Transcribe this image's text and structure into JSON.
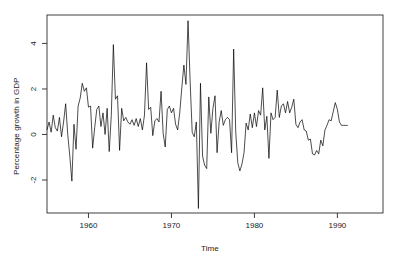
{
  "chart_data": {
    "type": "line",
    "title": "",
    "xlabel": "Time",
    "ylabel": "Percentage growth in GDP",
    "grid": false,
    "legend": null,
    "xlim": [
      1955.0,
      1995.5
    ],
    "ylim": [
      -3.45,
      5.25
    ],
    "xticks": [
      1960,
      1970,
      1980,
      1990
    ],
    "xtick_labels": [
      "1960",
      "1970",
      "1980",
      "1990"
    ],
    "yticks": [
      -2,
      0,
      2,
      4
    ],
    "ytick_labels": [
      "-2",
      "0",
      "2",
      "4"
    ],
    "line_color": "#000000",
    "line_width": 0.7,
    "x": [
      1955.0,
      1955.25,
      1955.5,
      1955.75,
      1956.0,
      1956.25,
      1956.5,
      1956.75,
      1957.0,
      1957.25,
      1957.5,
      1957.75,
      1958.0,
      1958.25,
      1958.5,
      1958.75,
      1959.0,
      1959.25,
      1959.5,
      1959.75,
      1960.0,
      1960.25,
      1960.5,
      1960.75,
      1961.0,
      1961.25,
      1961.5,
      1961.75,
      1962.0,
      1962.25,
      1962.5,
      1962.75,
      1963.0,
      1963.25,
      1963.5,
      1963.75,
      1964.0,
      1964.25,
      1964.5,
      1964.75,
      1965.0,
      1965.25,
      1965.5,
      1965.75,
      1966.0,
      1966.25,
      1966.5,
      1966.75,
      1967.0,
      1967.25,
      1967.5,
      1967.75,
      1968.0,
      1968.25,
      1968.5,
      1968.75,
      1969.0,
      1969.25,
      1969.5,
      1969.75,
      1970.0,
      1970.25,
      1970.5,
      1970.75,
      1971.0,
      1971.25,
      1971.5,
      1971.75,
      1972.0,
      1972.25,
      1972.5,
      1972.75,
      1973.0,
      1973.25,
      1973.5,
      1973.75,
      1974.0,
      1974.25,
      1974.5,
      1974.75,
      1975.0,
      1975.25,
      1975.5,
      1975.75,
      1976.0,
      1976.25,
      1976.5,
      1976.75,
      1977.0,
      1977.25,
      1977.5,
      1977.75,
      1978.0,
      1978.25,
      1978.5,
      1978.75,
      1979.0,
      1979.25,
      1979.5,
      1979.75,
      1980.0,
      1980.25,
      1980.5,
      1980.75,
      1981.0,
      1981.25,
      1981.5,
      1981.75,
      1982.0,
      1982.25,
      1982.5,
      1982.75,
      1983.0,
      1983.25,
      1983.5,
      1983.75,
      1984.0,
      1984.25,
      1984.5,
      1984.75,
      1985.0,
      1985.25,
      1985.5,
      1985.75,
      1986.0,
      1986.25,
      1986.5,
      1986.75,
      1987.0,
      1987.25,
      1987.5,
      1987.75,
      1988.0,
      1988.25,
      1988.5,
      1988.75,
      1989.0,
      1989.25,
      1989.5,
      1989.75,
      1990.0,
      1990.25,
      1990.5,
      1990.75,
      1991.0,
      1991.25,
      1991.5,
      1991.75,
      1992.0,
      1992.25,
      1992.5,
      1992.75,
      1993.0,
      1993.25,
      1993.5,
      1993.75,
      1994.0,
      1994.25,
      1994.5,
      1994.75,
      1995.0,
      1995.25
    ],
    "y": [
      0.2,
      0.55,
      0.1,
      0.85,
      0.3,
      0.15,
      0.75,
      -0.1,
      0.55,
      1.35,
      0.0,
      -0.95,
      -2.05,
      0.45,
      -0.65,
      1.25,
      1.6,
      2.25,
      1.9,
      2.05,
      1.2,
      1.25,
      -0.6,
      0.3,
      1.1,
      1.25,
      0.35,
      0.95,
      0.0,
      1.15,
      -0.75,
      0.85,
      3.95,
      1.55,
      1.7,
      -0.7,
      1.15,
      0.6,
      0.75,
      0.55,
      0.45,
      0.65,
      0.4,
      0.7,
      0.35,
      0.7,
      0.2,
      0.85,
      3.15,
      1.1,
      1.2,
      -0.05,
      0.6,
      0.7,
      0.55,
      1.9,
      0.05,
      -0.55,
      1.1,
      1.25,
      0.95,
      1.15,
      0.45,
      0.2,
      0.95,
      2.05,
      3.05,
      2.2,
      5.0,
      2.35,
      0.1,
      -0.1,
      0.55,
      -3.25,
      2.25,
      -0.95,
      -1.35,
      -1.5,
      1.65,
      0.05,
      1.15,
      1.7,
      -0.8,
      0.55,
      1.05,
      0.4,
      0.65,
      0.75,
      0.65,
      -0.8,
      3.75,
      0.1,
      -1.25,
      -1.6,
      -1.3,
      -0.8,
      0.5,
      0.2,
      0.9,
      0.3,
      0.95,
      0.35,
      1.05,
      0.85,
      2.05,
      0.2,
      0.8,
      -1.05,
      0.95,
      0.65,
      0.75,
      1.95,
      0.75,
      1.25,
      1.35,
      0.95,
      1.45,
      0.95,
      1.2,
      1.55,
      0.45,
      0.3,
      0.55,
      0.65,
      0.2,
      0.15,
      -0.25,
      -0.2,
      -0.85,
      -0.9,
      -0.7,
      -0.85,
      -0.25,
      -0.5,
      0.2,
      0.4,
      0.65,
      0.6,
      1.0,
      1.4,
      1.1,
      0.55,
      0.4,
      0.4,
      0.4,
      0.4
    ]
  }
}
